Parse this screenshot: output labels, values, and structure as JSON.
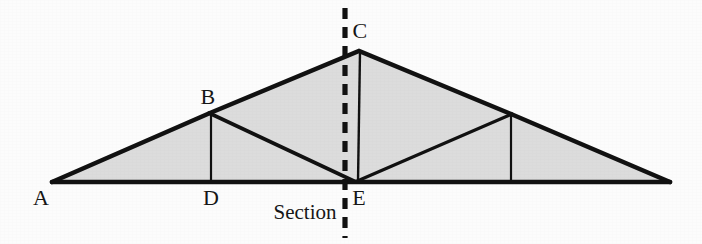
{
  "figure": {
    "type": "structural-truss-diagram",
    "background_color": "#fcfcfc",
    "fill_color": "#dcdcdc",
    "line_color": "#111111",
    "label_color": "#161616"
  },
  "labels": {
    "a": "A",
    "b": "B",
    "c": "C",
    "d": "D",
    "e": "E",
    "section": "Section"
  },
  "label_positions": {
    "a": {
      "x": 41,
      "y": 198
    },
    "b": {
      "x": 208,
      "y": 97
    },
    "c": {
      "x": 360,
      "y": 31
    },
    "d": {
      "x": 211,
      "y": 198
    },
    "e": {
      "x": 359,
      "y": 198
    },
    "section": {
      "x": 305,
      "y": 212
    }
  },
  "geometry": {
    "nodes": {
      "A": {
        "x": 52,
        "y": 182
      },
      "B": {
        "x": 210,
        "y": 113
      },
      "C": {
        "x": 359,
        "y": 51
      },
      "D": {
        "x": 211,
        "y": 182
      },
      "E": {
        "x": 355,
        "y": 182
      },
      "F": {
        "x": 511,
        "y": 114
      },
      "G": {
        "x": 511,
        "y": 182
      },
      "H": {
        "x": 670,
        "y": 182
      }
    },
    "shaded_outline": "A B C F H G E D",
    "members": [
      {
        "name": "bottom-chord-A-H",
        "from": "A",
        "to": "H",
        "weight": "thick"
      },
      {
        "name": "top-chord-A-C",
        "from": "A",
        "to": "C",
        "weight": "thick"
      },
      {
        "name": "top-chord-C-H",
        "from": "C",
        "to": "H",
        "weight": "thick"
      },
      {
        "name": "vertical-B-D",
        "from": "B",
        "to": "D",
        "weight": "thin"
      },
      {
        "name": "diagonal-B-E",
        "from": "B",
        "to": "E",
        "weight": "medium"
      },
      {
        "name": "vertical-C-E",
        "from": "C",
        "to": "E",
        "weight": "thin"
      },
      {
        "name": "diagonal-E-F",
        "from": "E",
        "to": "F",
        "weight": "medium"
      },
      {
        "name": "vertical-F-G",
        "from": "F",
        "to": "G",
        "weight": "thin"
      }
    ],
    "section_line": {
      "name": "section-cut-line",
      "x": 345,
      "y_top": 8,
      "y_bottom": 238,
      "style": "dashed",
      "stroke_width": 5,
      "dash": "11 8"
    }
  },
  "stroke_widths": {
    "thick": 4.5,
    "medium": 3.4,
    "thin": 2.2
  }
}
